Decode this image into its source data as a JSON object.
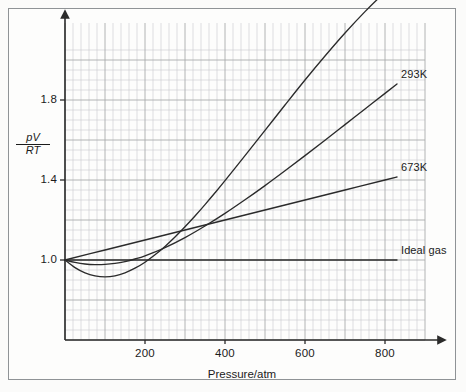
{
  "figure": {
    "background_color": "#fdfdfc",
    "frame_color": "#8f9396"
  },
  "chart_data": {
    "type": "line",
    "title": "",
    "xlabel": "Pressure/atm",
    "ylabel": "pV/RT",
    "ylabel_numerator": "pV",
    "ylabel_denominator": "RT",
    "xlim": [
      0,
      900
    ],
    "ylim": [
      0.6,
      2.05
    ],
    "xticks": [
      200,
      400,
      600,
      800
    ],
    "xtick_labels": [
      "200",
      "400",
      "600",
      "800"
    ],
    "yticks": [
      1.0,
      1.4,
      1.8
    ],
    "ytick_labels": [
      "1.0",
      "1.4",
      "1.8"
    ],
    "grid": true,
    "grid_minor_spacing_x": 20,
    "grid_minor_spacing_y": 0.05,
    "grid_major_spacing_x": 100,
    "grid_major_spacing_y": 0.2,
    "grid_color": "#c9cbcc",
    "grid_major_color": "#a9acad",
    "legend_position": "right-inline",
    "line_color": "#2b2b2b",
    "series": [
      {
        "name": "203K",
        "label": "203K",
        "color": "#2b2b2b",
        "points": [
          [
            0,
            1.0
          ],
          [
            25,
            0.962
          ],
          [
            50,
            0.936
          ],
          [
            75,
            0.921
          ],
          [
            100,
            0.916
          ],
          [
            125,
            0.921
          ],
          [
            150,
            0.936
          ],
          [
            175,
            0.959
          ],
          [
            200,
            0.989
          ],
          [
            225,
            1.026
          ],
          [
            250,
            1.068
          ],
          [
            275,
            1.115
          ],
          [
            300,
            1.166
          ],
          [
            325,
            1.22
          ],
          [
            350,
            1.277
          ],
          [
            375,
            1.336
          ],
          [
            400,
            1.397
          ],
          [
            450,
            1.522
          ],
          [
            500,
            1.648
          ],
          [
            550,
            1.775
          ],
          [
            600,
            1.9
          ],
          [
            650,
            2.02
          ],
          [
            700,
            2.135
          ],
          [
            750,
            2.242
          ],
          [
            800,
            2.34
          ],
          [
            830,
            2.395
          ]
        ]
      },
      {
        "name": "293K",
        "label": "293K",
        "color": "#2b2b2b",
        "points": [
          [
            0,
            1.0
          ],
          [
            25,
            0.988
          ],
          [
            50,
            0.98
          ],
          [
            75,
            0.977
          ],
          [
            100,
            0.978
          ],
          [
            125,
            0.983
          ],
          [
            150,
            0.992
          ],
          [
            175,
            1.005
          ],
          [
            200,
            1.021
          ],
          [
            250,
            1.062
          ],
          [
            300,
            1.112
          ],
          [
            350,
            1.17
          ],
          [
            400,
            1.233
          ],
          [
            450,
            1.301
          ],
          [
            500,
            1.372
          ],
          [
            550,
            1.446
          ],
          [
            600,
            1.522
          ],
          [
            650,
            1.599
          ],
          [
            700,
            1.677
          ],
          [
            750,
            1.755
          ],
          [
            800,
            1.833
          ],
          [
            830,
            1.88
          ]
        ]
      },
      {
        "name": "673K",
        "label": "673K",
        "color": "#2b2b2b",
        "points": [
          [
            0,
            1.0
          ],
          [
            100,
            1.05
          ],
          [
            200,
            1.1
          ],
          [
            300,
            1.15
          ],
          [
            400,
            1.2
          ],
          [
            500,
            1.25
          ],
          [
            600,
            1.3
          ],
          [
            700,
            1.35
          ],
          [
            800,
            1.4
          ],
          [
            830,
            1.415
          ]
        ]
      },
      {
        "name": "Ideal gas",
        "label": "Ideal gas",
        "color": "#2b2b2b",
        "points": [
          [
            0,
            1.0
          ],
          [
            830,
            1.0
          ]
        ]
      }
    ],
    "annotations": [
      {
        "text": "203K",
        "x": 845,
        "y": 2.4
      },
      {
        "text": "293K",
        "x": 845,
        "y": 1.885
      },
      {
        "text": "673K",
        "x": 845,
        "y": 1.415
      },
      {
        "text": "Ideal gas",
        "x": 845,
        "y": 1.0
      }
    ]
  }
}
